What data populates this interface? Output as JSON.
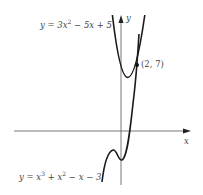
{
  "diagram": {
    "type": "function-graph",
    "axes": {
      "x_label": "x",
      "y_label": "y"
    },
    "curves": [
      {
        "name": "parabola",
        "equation_prefix": "y = 3x",
        "equation_exp": "2",
        "equation_suffix": " − 5x + 5"
      },
      {
        "name": "cubic",
        "equation_prefix": "y = x",
        "equation_exp": "3",
        "equation_mid": " + x",
        "equation_exp2": "2",
        "equation_suffix": " − x − 3"
      }
    ],
    "intersection_point": {
      "label": "(2, 7)",
      "x": 2,
      "y": 7
    }
  }
}
